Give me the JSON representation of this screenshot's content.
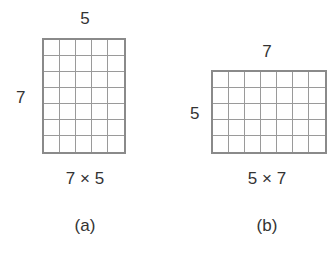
{
  "figure": {
    "background_color": "#ffffff",
    "grid_line_color": "#8a8a8a",
    "text_color": "#333333",
    "panels": [
      {
        "id": "a",
        "caption": "(a)",
        "top_label": "5",
        "left_label": "7",
        "bottom_label": "7 × 5",
        "columns": 5,
        "rows": 7
      },
      {
        "id": "b",
        "caption": "(b)",
        "top_label": "7",
        "left_label": "5",
        "bottom_label": "5 × 7",
        "columns": 7,
        "rows": 5
      }
    ]
  },
  "chart_data": {
    "type": "table",
    "title": "",
    "xlabel": "",
    "ylabel": "",
    "categories": [
      "(a)",
      "(b)"
    ],
    "series": [
      {
        "name": "columns",
        "values": [
          5,
          7
        ]
      },
      {
        "name": "rows",
        "values": [
          7,
          5
        ]
      },
      {
        "name": "cells",
        "values": [
          35,
          35
        ]
      }
    ],
    "annotations": [
      "5",
      "7",
      "7 × 5",
      "(a)",
      "7",
      "5",
      "5 × 7",
      "(b)"
    ],
    "grid": true,
    "legend": "none"
  }
}
